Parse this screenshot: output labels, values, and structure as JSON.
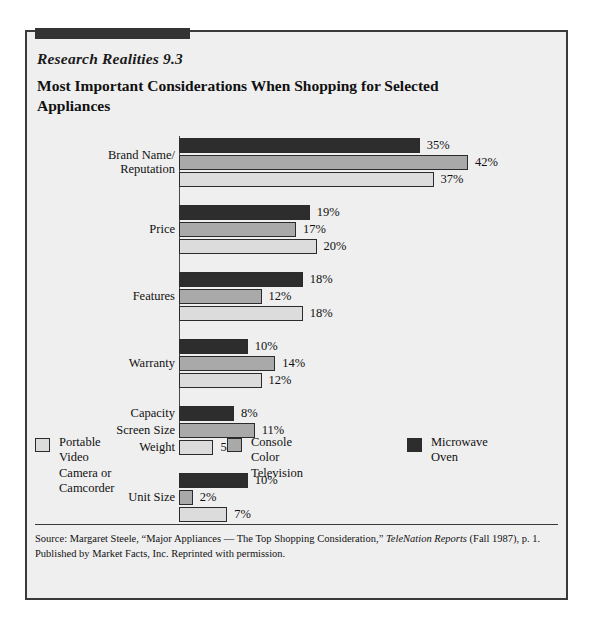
{
  "exhibit": {
    "series_label": "Research Realities 9.3",
    "title": "Most Important Considerations When Shopping for Selected Appliances",
    "source_prefix": "Source: Margaret Steele, “Major Appliances — The Top Shopping Consideration,” ",
    "source_italic": "TeleNation Reports",
    "source_suffix": " (Fall 1987), p. 1. Published by Market Facts, Inc. Reprinted with permission."
  },
  "colors": {
    "microwave": "#2d2d2d",
    "console": "#a9a9a9",
    "camera": "#dcdcdc",
    "frame": "#3a3a3a",
    "panel": "#efefef"
  },
  "chart_data": {
    "type": "bar",
    "orientation": "horizontal",
    "title": "Most Important Considerations When Shopping for Selected Appliances",
    "xlabel": "",
    "ylabel": "",
    "xlim": [
      0,
      42
    ],
    "grid": false,
    "legend_position": "bottom",
    "value_suffix": "%",
    "categories": [
      "Brand Name/ Reputation",
      "Price",
      "Features",
      "Warranty",
      "Capacity / Screen Size / Weight",
      "Unit Size"
    ],
    "series": [
      {
        "name": "Microwave Oven",
        "color": "#2d2d2d",
        "values": [
          35,
          19,
          18,
          10,
          8,
          10
        ]
      },
      {
        "name": "Console Color Television",
        "color": "#a9a9a9",
        "values": [
          42,
          17,
          12,
          14,
          11,
          2
        ]
      },
      {
        "name": "Portable Video Camera or Camcorder",
        "color": "#dcdcdc",
        "values": [
          37,
          20,
          18,
          12,
          5,
          7
        ]
      }
    ],
    "groups": [
      {
        "label_lines": [
          "Brand Name/",
          "Reputation"
        ],
        "per_bar_labels": false,
        "bars": [
          {
            "series": "Microwave Oven",
            "value": 35,
            "label": "35%"
          },
          {
            "series": "Console Color Television",
            "value": 42,
            "label": "42%"
          },
          {
            "series": "Portable Video Camera or Camcorder",
            "value": 37,
            "label": "37%"
          }
        ]
      },
      {
        "label_lines": [
          "Price"
        ],
        "per_bar_labels": false,
        "bars": [
          {
            "series": "Microwave Oven",
            "value": 19,
            "label": "19%"
          },
          {
            "series": "Console Color Television",
            "value": 17,
            "label": "17%"
          },
          {
            "series": "Portable Video Camera or Camcorder",
            "value": 20,
            "label": "20%"
          }
        ]
      },
      {
        "label_lines": [
          "Features"
        ],
        "per_bar_labels": false,
        "bars": [
          {
            "series": "Microwave Oven",
            "value": 18,
            "label": "18%"
          },
          {
            "series": "Console Color Television",
            "value": 12,
            "label": "12%"
          },
          {
            "series": "Portable Video Camera or Camcorder",
            "value": 18,
            "label": "18%"
          }
        ]
      },
      {
        "label_lines": [
          "Warranty"
        ],
        "per_bar_labels": false,
        "bars": [
          {
            "series": "Microwave Oven",
            "value": 10,
            "label": "10%"
          },
          {
            "series": "Console Color Television",
            "value": 14,
            "label": "14%"
          },
          {
            "series": "Portable Video Camera or Camcorder",
            "value": 12,
            "label": "12%"
          }
        ]
      },
      {
        "label_lines": [
          "Capacity",
          "Screen Size",
          "Weight"
        ],
        "per_bar_labels": true,
        "bars": [
          {
            "series": "Microwave Oven",
            "value": 8,
            "label": "8%",
            "row_label": "Capacity"
          },
          {
            "series": "Console Color Television",
            "value": 11,
            "label": "11%",
            "row_label": "Screen Size"
          },
          {
            "series": "Portable Video Camera or Camcorder",
            "value": 5,
            "label": "5%",
            "row_label": "Weight"
          }
        ]
      },
      {
        "label_lines": [
          "Unit Size"
        ],
        "per_bar_labels": false,
        "bars": [
          {
            "series": "Microwave Oven",
            "value": 10,
            "label": "10%"
          },
          {
            "series": "Console Color Television",
            "value": 2,
            "label": "2%"
          },
          {
            "series": "Portable Video Camera or Camcorder",
            "value": 7,
            "label": "7%"
          }
        ]
      }
    ],
    "legend": [
      {
        "name": "Portable Video Camera or Camcorder",
        "display": "Portable Video\nCamera or\nCamcorder",
        "color": "#dcdcdc"
      },
      {
        "name": "Console Color Television",
        "display": "Console Color\nTelevision",
        "color": "#a9a9a9"
      },
      {
        "name": "Microwave Oven",
        "display": "Microwave Oven",
        "color": "#2d2d2d"
      }
    ]
  }
}
